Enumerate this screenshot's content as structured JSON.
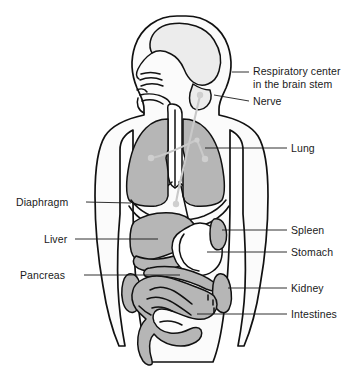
{
  "diagram": {
    "colors": {
      "organ_fill": "#b6b6b6",
      "organ_fill_light": "#c4c4c4",
      "body_fill": "#fbfbfb",
      "outline": "#111111",
      "nerve": "#c9c9c9",
      "text": "#1a1a1a",
      "background": "#ffffff"
    },
    "labels_right": [
      {
        "id": "respiratory-center",
        "lines": [
          "Respiratory center",
          "in the brain stem"
        ],
        "text_x": 253,
        "text_y": 75,
        "leader": "M 232 72 L 249 72"
      },
      {
        "id": "nerve",
        "lines": [
          "Nerve"
        ],
        "text_x": 253,
        "text_y": 104,
        "leader": "M 214 95 L 249 101"
      },
      {
        "id": "lung",
        "lines": [
          "Lung"
        ],
        "text_x": 291,
        "text_y": 152,
        "leader": "M 205 148 L 287 148"
      },
      {
        "id": "spleen",
        "lines": [
          "Spleen"
        ],
        "text_x": 291,
        "text_y": 232,
        "leader": "M 222 230 L 287 230"
      },
      {
        "id": "stomach",
        "lines": [
          "Stomach"
        ],
        "text_x": 291,
        "text_y": 254,
        "leader": "M 207 250 L 287 250"
      },
      {
        "id": "kidney",
        "lines": [
          "Kidney"
        ],
        "text_x": 291,
        "text_y": 291,
        "leader": "M 224 287 L 287 287"
      },
      {
        "id": "intestines",
        "lines": [
          "Intestines"
        ],
        "text_x": 291,
        "text_y": 317,
        "leader": "M 197 313 L 287 313"
      }
    ],
    "labels_left": [
      {
        "id": "diaphragm",
        "lines": [
          "Diaphragm"
        ],
        "text_x": 16,
        "text_y": 206,
        "anchor": "start",
        "leader": "M 83 202 L 131 202"
      },
      {
        "id": "liver",
        "lines": [
          "Liver"
        ],
        "text_x": 44,
        "text_y": 242,
        "anchor": "start",
        "leader": "M 72 238 L 152 238"
      },
      {
        "id": "pancreas",
        "lines": [
          "Pancreas"
        ],
        "text_x": 20,
        "text_y": 278,
        "anchor": "start",
        "leader": "M 80 274 L 166 274"
      }
    ],
    "organs": [
      {
        "id": "brain",
        "name": "brain"
      },
      {
        "id": "nasal-cavity",
        "name": "nasal cavity"
      },
      {
        "id": "trachea",
        "name": "trachea"
      },
      {
        "id": "lung-left",
        "name": "left lung"
      },
      {
        "id": "lung-right",
        "name": "right lung"
      },
      {
        "id": "diaphragm",
        "name": "diaphragm"
      },
      {
        "id": "liver",
        "name": "liver"
      },
      {
        "id": "stomach",
        "name": "stomach"
      },
      {
        "id": "spleen",
        "name": "spleen"
      },
      {
        "id": "pancreas",
        "name": "pancreas"
      },
      {
        "id": "kidney",
        "name": "kidney"
      },
      {
        "id": "intestines",
        "name": "intestines"
      }
    ]
  }
}
